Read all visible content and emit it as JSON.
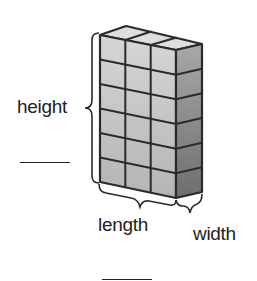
{
  "diagram": {
    "type": "rectangular-prism-of-unit-cubes",
    "cubes": {
      "length": 3,
      "width": 1,
      "height": 6
    },
    "labels": {
      "height": "height",
      "length": "length",
      "width": "width"
    },
    "answer_blanks": [
      {
        "id": "height-blank",
        "value": ""
      },
      {
        "id": "volume-blank",
        "value": ""
      }
    ],
    "colors": {
      "front_face": "#c8c8c8",
      "top_face": "#dcdcdc",
      "side_face": "#8f8f8f",
      "lines": "#2a2a2a"
    }
  }
}
